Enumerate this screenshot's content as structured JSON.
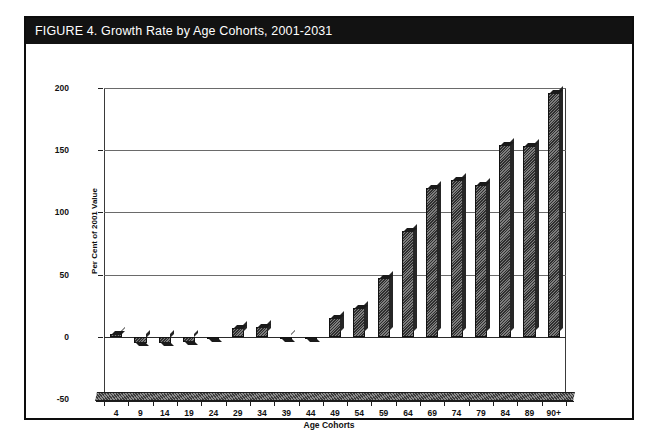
{
  "figure": {
    "title": "FIGURE 4. Growth Rate by Age Cohorts, 2001-2031",
    "title_bar_color": "#121212",
    "frame_color": "#0d0d0d",
    "bar_color": "#3b3b3b"
  },
  "chart_data": {
    "type": "bar",
    "title": "FIGURE 4. Growth Rate by Age Cohorts, 2001-2031",
    "xlabel": "Age Cohorts",
    "ylabel": "Per Cent of 2001 Value",
    "categories": [
      "4",
      "9",
      "14",
      "19",
      "24",
      "29",
      "34",
      "39",
      "44",
      "49",
      "54",
      "59",
      "64",
      "69",
      "74",
      "79",
      "84",
      "89",
      "90+"
    ],
    "values": [
      2,
      -5,
      -5,
      -4,
      -1,
      7,
      8,
      -2,
      -1,
      15,
      23,
      47,
      85,
      120,
      126,
      122,
      154,
      153,
      196
    ],
    "ylim": [
      -50,
      200
    ],
    "yticks": [
      -50,
      0,
      50,
      100,
      150,
      200
    ],
    "ytick_labels": [
      "-50",
      "0",
      "50",
      "100",
      "150",
      "200"
    ],
    "grid": true,
    "grid_axis": "y",
    "legend": "none",
    "series": [
      {
        "name": "Growth Rate 2001-2031",
        "values": [
          2,
          -5,
          -5,
          -4,
          -1,
          7,
          8,
          -2,
          -1,
          15,
          23,
          47,
          85,
          120,
          126,
          122,
          154,
          153,
          196
        ]
      }
    ]
  }
}
